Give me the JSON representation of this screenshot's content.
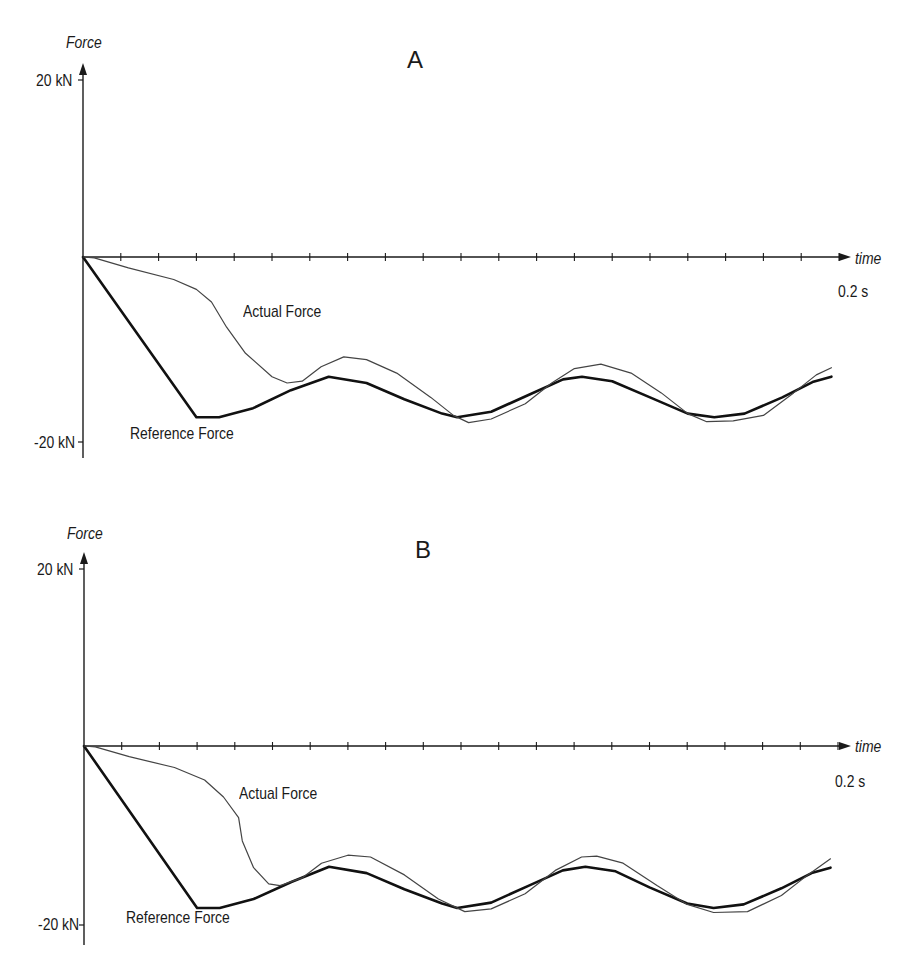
{
  "figure": {
    "panels": [
      {
        "id": "A",
        "title": "A",
        "y_axis_label": "Force",
        "x_axis_label": "time",
        "y_max_label": "20 kN",
        "y_min_label": "-20 kN",
        "x_max_label": "0.2 s",
        "actual_label": "Actual Force",
        "reference_label": "Reference Force"
      },
      {
        "id": "B",
        "title": "B",
        "y_axis_label": "Force",
        "x_axis_label": "time",
        "y_max_label": "20 kN",
        "y_min_label": "-20 kN",
        "x_max_label": "0.2 s",
        "actual_label": "Actual Force",
        "reference_label": "Reference Force"
      }
    ],
    "colors": {
      "axis": "#1a1a1a",
      "reference": "#111111",
      "actual": "#444444",
      "background": "#ffffff"
    }
  },
  "chart_data": [
    {
      "type": "line",
      "title": "A",
      "xlabel": "time",
      "ylabel": "Force",
      "x_unit": "s",
      "y_unit": "kN",
      "xlim": [
        0,
        0.2
      ],
      "ylim": [
        -20,
        20
      ],
      "x_ticks": {
        "count": 20,
        "step": 0.01,
        "labeled": [
          {
            "value": 0.2,
            "label": "0.2 s"
          }
        ]
      },
      "y_ticks": [
        {
          "value": 20,
          "label": "20 kN"
        },
        {
          "value": -20,
          "label": "-20 kN"
        }
      ],
      "grid": false,
      "legend": "inline annotations",
      "series": [
        {
          "name": "Reference Force",
          "style": "thick",
          "points": [
            [
              0,
              0
            ],
            [
              0.03,
              -17.8
            ],
            [
              0.036,
              -17.8
            ],
            [
              0.045,
              -16.8
            ],
            [
              0.055,
              -14.8
            ],
            [
              0.065,
              -13.3
            ],
            [
              0.075,
              -14.0
            ],
            [
              0.085,
              -15.8
            ],
            [
              0.095,
              -17.4
            ],
            [
              0.099,
              -17.8
            ],
            [
              0.108,
              -17.2
            ],
            [
              0.118,
              -15.3
            ],
            [
              0.127,
              -13.6
            ],
            [
              0.132,
              -13.3
            ],
            [
              0.14,
              -13.8
            ],
            [
              0.15,
              -15.6
            ],
            [
              0.16,
              -17.4
            ],
            [
              0.167,
              -17.8
            ],
            [
              0.175,
              -17.4
            ],
            [
              0.185,
              -15.6
            ],
            [
              0.193,
              -13.9
            ],
            [
              0.198,
              -13.3
            ]
          ]
        },
        {
          "name": "Actual Force",
          "style": "thin",
          "points": [
            [
              0,
              0
            ],
            [
              0.003,
              -0.1
            ],
            [
              0.012,
              -1.2
            ],
            [
              0.024,
              -2.5
            ],
            [
              0.03,
              -3.6
            ],
            [
              0.034,
              -5.0
            ],
            [
              0.038,
              -7.8
            ],
            [
              0.043,
              -10.7
            ],
            [
              0.05,
              -13.3
            ],
            [
              0.054,
              -14.0
            ],
            [
              0.058,
              -13.8
            ],
            [
              0.063,
              -12.2
            ],
            [
              0.069,
              -11.1
            ],
            [
              0.075,
              -11.4
            ],
            [
              0.083,
              -12.9
            ],
            [
              0.092,
              -15.6
            ],
            [
              0.098,
              -17.6
            ],
            [
              0.102,
              -18.4
            ],
            [
              0.108,
              -18.0
            ],
            [
              0.117,
              -16.3
            ],
            [
              0.124,
              -14.0
            ],
            [
              0.13,
              -12.4
            ],
            [
              0.137,
              -11.9
            ],
            [
              0.145,
              -12.9
            ],
            [
              0.153,
              -15.1
            ],
            [
              0.16,
              -17.4
            ],
            [
              0.165,
              -18.3
            ],
            [
              0.172,
              -18.2
            ],
            [
              0.18,
              -17.6
            ],
            [
              0.188,
              -15.1
            ],
            [
              0.194,
              -13.1
            ],
            [
              0.198,
              -12.3
            ]
          ]
        }
      ],
      "annotations": [
        {
          "text": "Actual Force",
          "near_t": 0.043,
          "near_F": -6.2
        },
        {
          "text": "Reference Force",
          "near_t": 0.012,
          "near_F": -19.5
        }
      ]
    },
    {
      "type": "line",
      "title": "B",
      "xlabel": "time",
      "ylabel": "Force",
      "x_unit": "s",
      "y_unit": "kN",
      "xlim": [
        0,
        0.2
      ],
      "ylim": [
        -20,
        20
      ],
      "x_ticks": {
        "count": 20,
        "step": 0.01,
        "labeled": [
          {
            "value": 0.2,
            "label": "0.2 s"
          }
        ]
      },
      "y_ticks": [
        {
          "value": 20,
          "label": "20 kN"
        },
        {
          "value": -20,
          "label": "-20 kN"
        }
      ],
      "grid": false,
      "legend": "inline annotations",
      "series": [
        {
          "name": "Reference Force",
          "style": "thick",
          "points": [
            [
              0,
              0
            ],
            [
              0.03,
              -18.1
            ],
            [
              0.036,
              -18.1
            ],
            [
              0.045,
              -17.1
            ],
            [
              0.055,
              -15.2
            ],
            [
              0.065,
              -13.5
            ],
            [
              0.075,
              -14.2
            ],
            [
              0.085,
              -16.0
            ],
            [
              0.095,
              -17.6
            ],
            [
              0.099,
              -18.1
            ],
            [
              0.108,
              -17.5
            ],
            [
              0.118,
              -15.6
            ],
            [
              0.127,
              -13.9
            ],
            [
              0.133,
              -13.5
            ],
            [
              0.141,
              -14.0
            ],
            [
              0.15,
              -15.8
            ],
            [
              0.16,
              -17.6
            ],
            [
              0.167,
              -18.1
            ],
            [
              0.175,
              -17.7
            ],
            [
              0.185,
              -15.9
            ],
            [
              0.193,
              -14.2
            ],
            [
              0.198,
              -13.6
            ]
          ]
        },
        {
          "name": "Actual Force",
          "style": "thin",
          "points": [
            [
              0,
              0
            ],
            [
              0.003,
              -0.1
            ],
            [
              0.012,
              -1.2
            ],
            [
              0.024,
              -2.4
            ],
            [
              0.032,
              -3.8
            ],
            [
              0.037,
              -5.7
            ],
            [
              0.041,
              -8.0
            ],
            [
              0.042,
              -10.6
            ],
            [
              0.045,
              -13.6
            ],
            [
              0.049,
              -15.4
            ],
            [
              0.052,
              -15.6
            ],
            [
              0.058,
              -14.7
            ],
            [
              0.063,
              -13.1
            ],
            [
              0.07,
              -12.2
            ],
            [
              0.076,
              -12.4
            ],
            [
              0.085,
              -14.4
            ],
            [
              0.094,
              -17.1
            ],
            [
              0.101,
              -18.5
            ],
            [
              0.108,
              -18.2
            ],
            [
              0.117,
              -16.5
            ],
            [
              0.125,
              -13.9
            ],
            [
              0.132,
              -12.4
            ],
            [
              0.136,
              -12.3
            ],
            [
              0.143,
              -13.1
            ],
            [
              0.152,
              -15.6
            ],
            [
              0.16,
              -17.7
            ],
            [
              0.167,
              -18.6
            ],
            [
              0.176,
              -18.5
            ],
            [
              0.185,
              -16.7
            ],
            [
              0.192,
              -14.4
            ],
            [
              0.198,
              -12.6
            ]
          ]
        }
      ],
      "annotations": [
        {
          "text": "Actual Force",
          "near_t": 0.041,
          "near_F": -5.3
        },
        {
          "text": "Reference Force",
          "near_t": 0.011,
          "near_F": -19.9
        }
      ]
    }
  ]
}
